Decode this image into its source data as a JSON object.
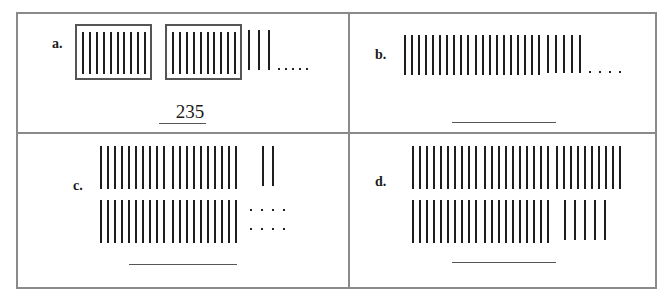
{
  "worksheet": {
    "problems": [
      {
        "id": "a",
        "label": "a.",
        "bundles_of_ten": 2,
        "bundles_boxed": true,
        "loose_sticks": 3,
        "dots": 5,
        "answer": "235"
      },
      {
        "id": "b",
        "label": "b.",
        "bundles_of_ten": 2,
        "bundles_boxed": false,
        "loose_sticks": 5,
        "dots": 4,
        "answer": ""
      },
      {
        "id": "c",
        "label": "c.",
        "bundles_of_ten": 4,
        "bundles_boxed": false,
        "loose_sticks": 2,
        "dots": 8,
        "answer": ""
      },
      {
        "id": "d",
        "label": "d.",
        "bundles_of_ten": 5,
        "bundles_boxed": false,
        "loose_sticks": 5,
        "dots": 0,
        "answer": ""
      }
    ]
  },
  "colors": {
    "border": "#8a8a8a",
    "stick": "#1e1e1e",
    "box": "#555555"
  }
}
